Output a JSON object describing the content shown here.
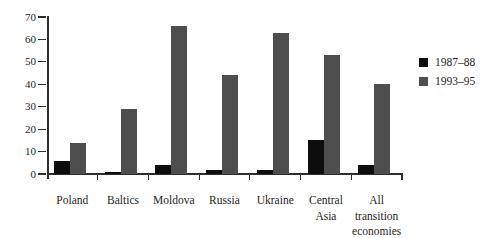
{
  "colors": {
    "background": "#ffffff",
    "axis": "#2e2e2e",
    "text": "#1e1e1e",
    "series_1987_88": "#0d0d0d",
    "series_1993_95": "#4e4e4e"
  },
  "chart_data": {
    "type": "bar",
    "title": "",
    "xlabel": "",
    "ylabel": "",
    "ylim": [
      0,
      70
    ],
    "ytick_step": 10,
    "ytick_labels": [
      "0",
      "10",
      "20",
      "30",
      "40",
      "50",
      "60",
      "70"
    ],
    "grid": false,
    "categories": [
      "Poland",
      "Baltics",
      "Moldova",
      "Russia",
      "Ukraine",
      "Central Asia",
      "All transition economies"
    ],
    "category_label_lines": [
      [
        "Poland"
      ],
      [
        "Baltics"
      ],
      [
        "Moldova"
      ],
      [
        "Russia"
      ],
      [
        "Ukraine"
      ],
      [
        "Central",
        "Asia"
      ],
      [
        "All",
        "transition",
        "economies"
      ]
    ],
    "series": [
      {
        "name": "1987–88",
        "color": "#0d0d0d",
        "values": [
          6,
          1,
          4,
          2,
          2,
          15,
          4
        ]
      },
      {
        "name": "1993–95",
        "color": "#4e4e4e",
        "values": [
          14,
          29,
          66,
          44,
          63,
          53,
          40
        ]
      }
    ],
    "legend": {
      "position": "right",
      "entries": [
        {
          "label": "1987–88",
          "color": "#0d0d0d"
        },
        {
          "label": "1993–95",
          "color": "#4e4e4e"
        }
      ]
    }
  }
}
